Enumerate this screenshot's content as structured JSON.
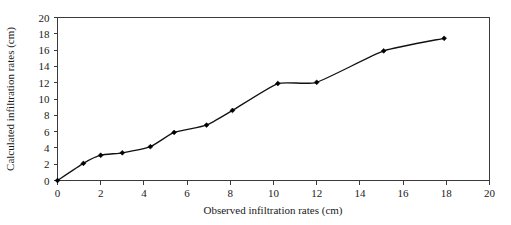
{
  "chart_data": {
    "type": "line",
    "title": "",
    "xlabel": "Observed infiltration rates (cm)",
    "ylabel": "Calculated infiltration rates (cm)",
    "xlim": [
      0,
      20
    ],
    "ylim": [
      0,
      20
    ],
    "xticks": [
      0,
      2,
      4,
      6,
      8,
      10,
      12,
      14,
      16,
      18,
      20
    ],
    "yticks": [
      0,
      2,
      4,
      6,
      8,
      10,
      12,
      14,
      16,
      18,
      20
    ],
    "grid": false,
    "legend": false,
    "marker": "filled-diamond",
    "line_color": "#111111",
    "marker_color": "#000000",
    "series": [
      {
        "name": "Calculated vs observed infiltration",
        "x": [
          0.0,
          1.2,
          2.0,
          3.0,
          4.3,
          5.4,
          6.9,
          8.1,
          10.2,
          12.0,
          15.1,
          17.9
        ],
        "y": [
          0.0,
          2.1,
          3.1,
          3.4,
          4.15,
          5.9,
          6.8,
          8.6,
          11.9,
          12.05,
          15.9,
          17.45
        ]
      }
    ]
  },
  "axes": {
    "x_tick_labels": [
      "0",
      "2",
      "4",
      "6",
      "8",
      "10",
      "12",
      "14",
      "16",
      "18",
      "20"
    ],
    "y_tick_labels": [
      "0",
      "2",
      "4",
      "6",
      "8",
      "10",
      "12",
      "14",
      "16",
      "18",
      "20"
    ],
    "x_axis_title": "Observed infiltration rates (cm)",
    "y_axis_title": "Calculated infiltration rates (cm)"
  }
}
